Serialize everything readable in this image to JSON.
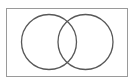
{
  "figure": {
    "name": "venn-diagram",
    "type": "venn-2-set",
    "title": "",
    "caption": "",
    "canvas": {
      "width": 135,
      "height": 84,
      "background_color": "#ffffff"
    },
    "frame": {
      "name": "figure-border",
      "x": 6,
      "y": 8,
      "width": 122,
      "height": 69,
      "stroke_color": "#9a9a9a",
      "stroke_width": 1,
      "fill_color": "#ffffff"
    },
    "circles": [
      {
        "name": "left-set-circle",
        "label": "",
        "cx": 49,
        "cy": 42,
        "r": 27.5,
        "stroke_color": "#585858",
        "stroke_width": 1.3,
        "fill": "none"
      },
      {
        "name": "right-set-circle",
        "label": "",
        "cx": 85.5,
        "cy": 42,
        "r": 27.5,
        "stroke_color": "#585858",
        "stroke_width": 1.3,
        "fill": "none"
      }
    ],
    "regions": [
      {
        "name": "left-only-region",
        "label": ""
      },
      {
        "name": "intersection-region",
        "label": ""
      },
      {
        "name": "right-only-region",
        "label": ""
      }
    ],
    "labels": []
  }
}
